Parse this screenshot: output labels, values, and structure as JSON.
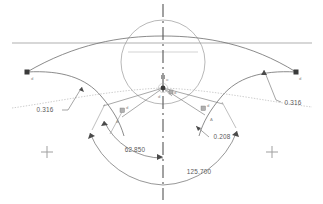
{
  "drawing": {
    "title": "Spline Curvature Construction",
    "background_color": "#ffffff",
    "width": 323,
    "height": 204
  },
  "colors": {
    "geometry_line": "#6d6d6d",
    "construction_line": "#9a9a9a",
    "dimension_line": "#6a6a6a",
    "centerline": "#555555",
    "dotted_curve": "#b9b9b9",
    "text": "#5a5a5a",
    "marker": "#3a3a3a",
    "crosshair": "#9f9f9f"
  },
  "dimensions": [
    {
      "id": "angle-inner",
      "type": "angular",
      "value": "62.850",
      "label": "62.850",
      "x": 135,
      "y": 152
    },
    {
      "id": "angle-outer",
      "type": "angular",
      "value": "125.700",
      "label": "125.700",
      "x": 199,
      "y": 174
    },
    {
      "id": "offset-left",
      "type": "linear",
      "value": "0.316",
      "label": "0.316",
      "x": 45,
      "y": 112
    },
    {
      "id": "offset-right",
      "type": "linear",
      "value": "0.316",
      "label": "0.316",
      "x": 282,
      "y": 105
    },
    {
      "id": "radius-inner",
      "type": "linear",
      "value": "0.208",
      "label": "0.208",
      "x": 212,
      "y": 139
    }
  ],
  "markers": {
    "endpoint_left": {
      "x": 27,
      "y": 72
    },
    "endpoint_right": {
      "x": 296,
      "y": 72
    },
    "origin": {
      "x": 163,
      "y": 88
    },
    "crosshair_left": {
      "x": 47,
      "y": 152
    },
    "crosshair_right": {
      "x": 272,
      "y": 152
    }
  },
  "point_labels": [
    {
      "id": "label-left-endpoint",
      "text": "d",
      "x": 31,
      "y": 80
    },
    {
      "id": "label-right-endpoint",
      "text": "d",
      "x": 299,
      "y": 80
    },
    {
      "id": "label-origin-upper",
      "text": "o",
      "x": 165,
      "y": 82
    },
    {
      "id": "label-origin-lower",
      "text": "d",
      "x": 161,
      "y": 97
    },
    {
      "id": "label-right-of-origin",
      "text": "d",
      "x": 172,
      "y": 93
    },
    {
      "id": "label-arc-left",
      "text": "d",
      "x": 124,
      "y": 112
    },
    {
      "id": "label-arc-right",
      "text": "d",
      "x": 204,
      "y": 110
    },
    {
      "id": "label-tri-left",
      "text": "A",
      "x": 117,
      "y": 122
    },
    {
      "id": "label-tri-right",
      "text": "A",
      "x": 211,
      "y": 120
    }
  ],
  "geometry": {
    "circle": {
      "cx": 163,
      "cy": 62,
      "r": 42
    },
    "horizontal_datum_y": 43,
    "centerline_x": 163,
    "centerline_top": 4,
    "centerline_bottom": 200
  }
}
